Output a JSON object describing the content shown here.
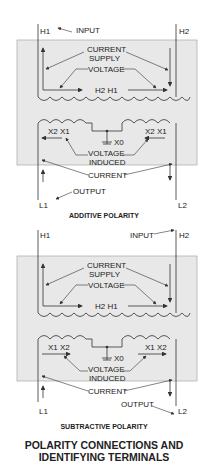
{
  "colors": {
    "panel": "#e8e8e8",
    "line": "#333333",
    "background": "#ffffff"
  },
  "additive": {
    "caption": "ADDITIVE POLARITY",
    "h1": "H1",
    "h2": "H2",
    "input": "INPUT",
    "current_supply_1": "CURRENT",
    "current_supply_2": "SUPPLY",
    "voltage": "VOLTAGE",
    "primary_center": "H2 H1",
    "x_left": "X2 X1",
    "x_right": "X2 X1",
    "x0": "X0",
    "voltage_induced_1": "VOLTAGE",
    "voltage_induced_2": "INDUCED",
    "current": "CURRENT",
    "output": "OUTPUT",
    "l1": "L1",
    "l2": "L2"
  },
  "subtractive": {
    "caption": "SUBTRACTIVE POLARITY",
    "h1": "H1",
    "h2": "H2",
    "input": "INPUT",
    "current_supply_1": "CURRENT",
    "current_supply_2": "SUPPLY",
    "voltage": "VOLTAGE",
    "primary_center": "H2 H1",
    "x_left": "X1 X2",
    "x_right": "X1 X2",
    "x0": "X0",
    "voltage_induced_1": "VOLTAGE",
    "voltage_induced_2": "INDUCED",
    "current": "CURRENT",
    "output": "OUTPUT",
    "l1": "L1",
    "l2": "L2"
  },
  "title": {
    "line1": "POLARITY CONNECTIONS AND",
    "line2": "IDENTIFYING TERMINALS"
  }
}
